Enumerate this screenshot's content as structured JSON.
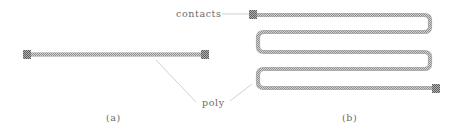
{
  "figure": {
    "labels": {
      "contacts": "contacts",
      "poly": "poly",
      "panel_a": "(a)",
      "panel_b": "(b)"
    },
    "colors": {
      "poly_fill": "#b5b5b5",
      "poly_edge": "#8c8c8c",
      "contact": "#8a8a8a",
      "leader": "#c8c8c8",
      "text": "#6a6a6a"
    },
    "panels": [
      {
        "id": "a",
        "description": "straight poly resistor with contacts at both ends"
      },
      {
        "id": "b",
        "description": "serpentine (meander) poly resistor with contacts at both ends"
      }
    ]
  }
}
